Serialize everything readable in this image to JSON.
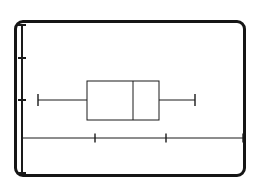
{
  "figure": {
    "kind": "box-and-whisker-plot",
    "frame": {
      "style": "rounded-rectangle-border",
      "color": "#151515",
      "x": 14,
      "y": 20,
      "width": 232,
      "height": 157,
      "corner_radius": 9,
      "stroke_width": 3
    },
    "background_color": "#ffffff",
    "ink_color": "#1a1a1a"
  },
  "chart_data": {
    "type": "box",
    "title": "",
    "subtitle": "",
    "xlabel": "",
    "ylabel": "",
    "legend": [],
    "annotations": [],
    "grid": false,
    "orientation": "horizontal",
    "xlim": [
      22,
      243
    ],
    "ylim": [
      25,
      173
    ],
    "xaxis": {
      "line_y": 138,
      "x_start": 22,
      "x_end": 243,
      "tick_positions": [
        95,
        166,
        243
      ],
      "tick_labels": [
        "",
        "",
        ""
      ],
      "tick_length": 9,
      "stroke_width": 1
    },
    "yaxis": {
      "line_x": 22,
      "y_start": 25,
      "y_end": 173,
      "tick_positions": [
        25,
        58,
        100,
        173
      ],
      "tick_labels": [
        "",
        "",
        "",
        ""
      ],
      "tick_length": 8,
      "stroke_width": 2
    },
    "box": {
      "whisker_low_x": 38,
      "q1_x": 87,
      "median_x": 133,
      "q3_x": 159,
      "whisker_high_x": 195,
      "box_top_y": 81,
      "box_bottom_y": 120,
      "center_y": 100,
      "cap_half_height": 6,
      "stroke_width": 1
    }
  }
}
